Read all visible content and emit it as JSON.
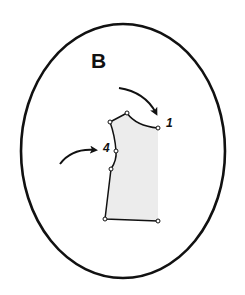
{
  "diagram": {
    "panel_label": "B",
    "point_labels": {
      "neckline_point": "1",
      "armhole_point": "4"
    },
    "colors": {
      "stroke": "#111111",
      "fill": "#ececec",
      "background": "#ffffff"
    },
    "frame": {
      "shape": "ellipse",
      "cx": 123,
      "cy": 151,
      "rx": 102,
      "ry": 127
    },
    "pattern_piece": {
      "description": "bodice pattern piece",
      "points": [
        {
          "x": 110,
          "y": 122
        },
        {
          "x": 127,
          "y": 113
        },
        {
          "x": 158,
          "y": 128
        },
        {
          "x": 158,
          "y": 221
        },
        {
          "x": 105,
          "y": 219
        },
        {
          "x": 111,
          "y": 169
        },
        {
          "x": 116,
          "y": 151
        }
      ]
    },
    "arrows": [
      {
        "name": "arrow-to-point-1",
        "target_label": "1"
      },
      {
        "name": "arrow-to-point-4",
        "target_label": "4"
      }
    ]
  }
}
